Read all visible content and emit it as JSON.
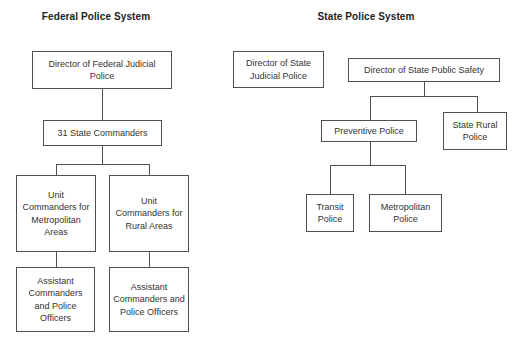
{
  "federal": {
    "title": "Federal Police System",
    "nodes": {
      "director": "Director of Federal Judicial Police",
      "commanders": "31 State Commanders",
      "unit_metro": "Unit Commanders for Metropolitan Areas",
      "unit_rural": "Unit Commanders for Rural Areas",
      "asst_metro": "Assistant Commanders and Police Officers",
      "asst_rural": "Assistant Commanders and Police Officers"
    }
  },
  "state": {
    "title": "State Police System",
    "nodes": {
      "director_judicial": "Director of State Judicial Police",
      "director_safety": "Director of State Public Safety",
      "preventive": "Preventive Police",
      "state_rural": "State Rural Police",
      "transit": "Transit Police",
      "metropolitan": "Metropolitan Police"
    }
  },
  "colors": {
    "border": "#4f4f4f",
    "text": "#333333",
    "background": "#ffffff"
  }
}
